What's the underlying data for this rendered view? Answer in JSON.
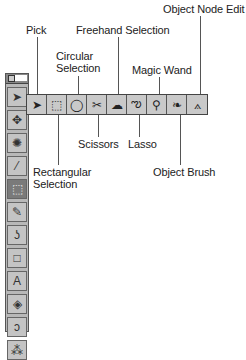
{
  "labels": {
    "pick": "Pick",
    "circular_selection": [
      "Circular",
      "Selection"
    ],
    "freehand_selection": "Freehand Selection",
    "magic_wand": "Magic Wand",
    "object_node_edit": "Object Node Edit",
    "rectangular_selection": [
      "Rectangular",
      "Selection"
    ],
    "scissors": "Scissors",
    "lasso": "Lasso",
    "object_brush": "Object Brush"
  },
  "flyout_tools": [
    {
      "name": "pick",
      "glyph": "➤"
    },
    {
      "name": "rectangular-selection",
      "glyph": "⬚"
    },
    {
      "name": "circular-selection",
      "glyph": "◯"
    },
    {
      "name": "scissors",
      "glyph": "✂"
    },
    {
      "name": "freehand-selection",
      "glyph": "☁"
    },
    {
      "name": "lasso",
      "glyph": "ఌ"
    },
    {
      "name": "magic-wand",
      "glyph": "⚲"
    },
    {
      "name": "object-brush",
      "glyph": "❧"
    },
    {
      "name": "object-node-edit",
      "glyph": "⟑"
    }
  ],
  "toolbox_tools": [
    {
      "name": "pick",
      "glyph": "➤"
    },
    {
      "name": "zoom-pan",
      "glyph": "✥"
    },
    {
      "name": "color",
      "glyph": "✺"
    },
    {
      "name": "eyedropper",
      "glyph": "⁄"
    },
    {
      "name": "mask-selection",
      "glyph": "⬚"
    },
    {
      "name": "paintbrush",
      "glyph": "✎"
    },
    {
      "name": "effect-brush",
      "glyph": "ʖ"
    },
    {
      "name": "rectangle",
      "glyph": "□"
    },
    {
      "name": "text",
      "glyph": "A"
    },
    {
      "name": "fill",
      "glyph": "◈"
    },
    {
      "name": "clone",
      "glyph": "ↄ"
    },
    {
      "name": "image-sprayer",
      "glyph": "⁂"
    }
  ]
}
